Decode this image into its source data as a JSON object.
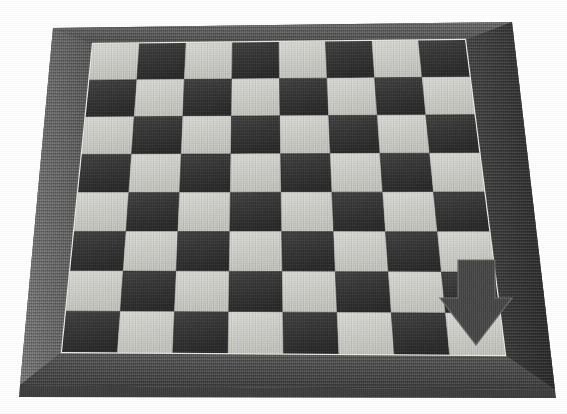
{
  "image": {
    "kind": "photograph",
    "subject": "chessboard",
    "color_mode": "grayscale",
    "width": 567,
    "height": 414,
    "background": "#ffffff"
  },
  "captions": {
    "top_cropped_text": "the board, as seen from the side,",
    "left_cropped_text": "e"
  },
  "board": {
    "label": "chessboard",
    "rows": 8,
    "columns": 8,
    "total_squares": 64,
    "top_left_square_color": "light",
    "frame_label": "wooden board frame",
    "playfield_label": "checkered playing surface",
    "colors": {
      "light_square": "#dcdcd8",
      "light_square_shade": "#c9c9c4",
      "dark_square": "#3d3d3d",
      "dark_square_shade": "#2e2e2e",
      "frame_top": "#5d5d5d",
      "frame_left": "#6a6a6a",
      "frame_right": "#3a3a3a",
      "frame_bottom": "#4e4e4e",
      "frame_edge": "#262626",
      "inner_rim": "#e8e8e4"
    },
    "outer_quad": [
      [
        53,
        28
      ],
      [
        512,
        22
      ],
      [
        555,
        390
      ],
      [
        20,
        385
      ]
    ],
    "inner_quad": [
      [
        93,
        44
      ],
      [
        465,
        40
      ],
      [
        505,
        355
      ],
      [
        62,
        352
      ]
    ]
  },
  "overlay": {
    "arrow": {
      "label": "down arrow annotation",
      "direction": "down",
      "color": "#4a4a4a",
      "stroke": "#6f6f6f",
      "points": "458,260 495,260 495,298 512,298 476,345 440,298 458,298",
      "tip": [
        476,
        345
      ],
      "target_square_file": 8,
      "target_square_rank": 1
    }
  }
}
